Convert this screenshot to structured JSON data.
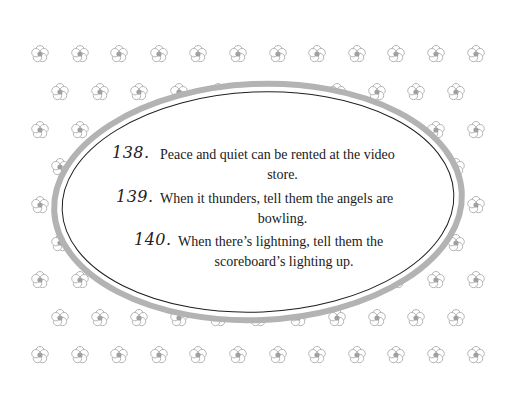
{
  "page": {
    "background_color": "#ffffff",
    "pattern": {
      "icon": "five-petal-flower-icon",
      "outline_color": "#b5b5b5",
      "center_color": "#a0a0a0",
      "row_y": [
        54,
        92,
        130,
        167,
        205,
        243,
        280,
        318,
        355
      ],
      "odd_row_x_start": 40,
      "even_row_x_start": 60,
      "column_spacing": 39.6,
      "columns": 12
    },
    "frame": {
      "shape": "oval",
      "outer_ring_color": "#b3b3b3",
      "inner_line_color": "#1f1f1f",
      "fill_color": "#ffffff"
    }
  },
  "entries": [
    {
      "number": "138.",
      "line1": "Peace and quiet can be rented at the video",
      "line2": "store."
    },
    {
      "number": "139.",
      "line1": "When it thunders, tell them the angels are",
      "line2": "bowling."
    },
    {
      "number": "140.",
      "line1": "When there’s lightning, tell them the",
      "line2": "scoreboard’s lighting up."
    }
  ]
}
